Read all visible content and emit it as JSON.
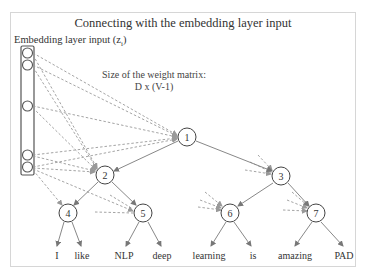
{
  "title": "Connecting with the embedding layer input",
  "embedding": {
    "label": "Embedding layer input (z",
    "subscript": "i",
    "label_close": ")",
    "circle_count": 5
  },
  "weight_matrix": {
    "line1": "Size of the weight matrix:",
    "line2": "D x (V-1)"
  },
  "tree": {
    "nodes": [
      {
        "id": "1",
        "label": "1"
      },
      {
        "id": "2",
        "label": "2"
      },
      {
        "id": "3",
        "label": "3"
      },
      {
        "id": "4",
        "label": "4"
      },
      {
        "id": "5",
        "label": "5"
      },
      {
        "id": "6",
        "label": "6"
      },
      {
        "id": "7",
        "label": "7"
      }
    ],
    "edges": [
      [
        "1",
        "2"
      ],
      [
        "1",
        "3"
      ],
      [
        "2",
        "4"
      ],
      [
        "2",
        "5"
      ],
      [
        "3",
        "6"
      ],
      [
        "3",
        "7"
      ]
    ],
    "leaves": [
      "I",
      "like",
      "NLP",
      "deep",
      "learning",
      "is",
      "amazing",
      "PAD"
    ]
  },
  "colors": {
    "edge": "#888888",
    "dashed": "#9a9a9a",
    "node_stroke": "#444444",
    "frame": "#d6d6d6"
  }
}
